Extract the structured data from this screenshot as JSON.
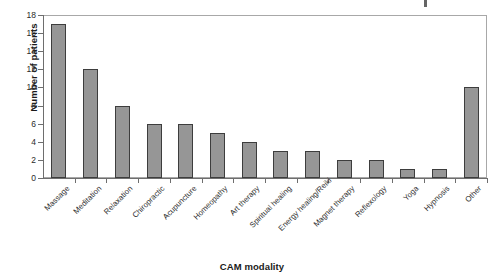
{
  "chart_data": {
    "type": "bar",
    "title": "",
    "xlabel": "CAM modality",
    "ylabel": "Number of patients",
    "ylim": [
      0,
      18
    ],
    "ytick_step": 2,
    "grid": false,
    "legend": null,
    "bar_color": "#969696",
    "bar_border_color": "#3d3d3d",
    "axis_color": "#6e6e6e",
    "categories": [
      "Massage",
      "Meditation",
      "Relaxation",
      "Chiropractic",
      "Acupuncture",
      "Homeopathy",
      "Art therapy",
      "Spiritual healing",
      "Energy healing/Reiki",
      "Magnet therapy",
      "Reflexology",
      "Yoga",
      "Hypnosis",
      "Other"
    ],
    "values": [
      17,
      12,
      8,
      6,
      6,
      5,
      4,
      3,
      3,
      2,
      2,
      1,
      1,
      10
    ],
    "yticks": [
      0,
      2,
      4,
      6,
      8,
      10,
      12,
      14,
      16,
      18
    ]
  }
}
